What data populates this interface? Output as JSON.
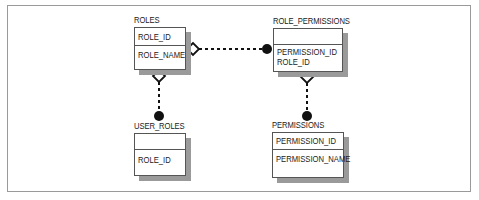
{
  "diagram": {
    "type": "entity-relationship",
    "entities": [
      {
        "id": "roles",
        "title": "ROLES",
        "key_fields": [
          "ROLE_ID"
        ],
        "fields": [
          "ROLE_NAME"
        ]
      },
      {
        "id": "role_permissions",
        "title": "ROLE_PERMISSIONS",
        "key_fields": [],
        "fields": [
          "PERMISSION_ID",
          "ROLE_ID"
        ]
      },
      {
        "id": "user_roles",
        "title": "USER_ROLES",
        "key_fields": [],
        "fields": [
          "ROLE_ID"
        ]
      },
      {
        "id": "permissions",
        "title": "PERMISSIONS",
        "key_fields": [
          "PERMISSION_ID"
        ],
        "fields": [
          "PERMISSION_NAME"
        ]
      }
    ],
    "relationships": [
      {
        "from": "ROLES",
        "to": "ROLE_PERMISSIONS",
        "from_end": "hollow-diamond",
        "to_end": "filled-circle",
        "line": "dashed"
      },
      {
        "from": "ROLES",
        "to": "USER_ROLES",
        "from_end": "hollow-diamond",
        "to_end": "filled-circle",
        "line": "dashed"
      },
      {
        "from": "PERMISSIONS",
        "to": "ROLE_PERMISSIONS",
        "from_end": "filled-circle",
        "to_end": "hollow-diamond",
        "line": "dashed"
      }
    ],
    "colors": {
      "box_border": "#555555",
      "shadow": "#9a9a9a",
      "frame": "#9a9a9a",
      "connector": "#111111"
    }
  }
}
